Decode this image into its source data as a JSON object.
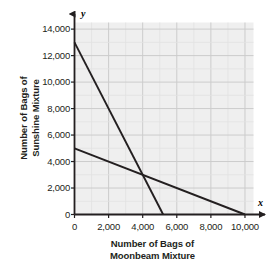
{
  "chart_data": {
    "type": "line",
    "title": "",
    "xlabel": "Number of Bags of Moonbeam Mixture",
    "ylabel": "Number of Bags of Sunshine Mixture",
    "xlabel_line1": "Number of Bags of",
    "xlabel_line2": "Moonbeam Mixture",
    "ylabel_line1": "Number of Bags of",
    "ylabel_line2": "Sunshine Mixture",
    "x_axis_letter": "x",
    "y_axis_letter": "y",
    "xlim": [
      0,
      10500
    ],
    "ylim": [
      0,
      14500
    ],
    "xticks": [
      0,
      2000,
      4000,
      6000,
      8000,
      10000
    ],
    "xtick_labels": [
      "0",
      "2,000",
      "4,000",
      "6,000",
      "8,000",
      "10,000"
    ],
    "yticks": [
      0,
      2000,
      4000,
      6000,
      8000,
      10000,
      12000,
      14000
    ],
    "ytick_labels": [
      "0",
      "2,000",
      "4,000",
      "6,000",
      "8,000",
      "10,000",
      "12,000",
      "14,000"
    ],
    "grid": true,
    "grid_minor_step_x": 1000,
    "grid_minor_step_y": 1000,
    "grid_color": "#d9d9d9",
    "plot_background": "#efefef",
    "line_color": "#231f20",
    "legend": "none",
    "series": [
      {
        "name": "steep-line",
        "points": [
          [
            0,
            13000
          ],
          [
            5200,
            0
          ]
        ],
        "x_intercept": 5200,
        "y_intercept": 13000
      },
      {
        "name": "shallow-line",
        "points": [
          [
            0,
            5000
          ],
          [
            10000,
            0
          ]
        ],
        "x_intercept": 10000,
        "y_intercept": 5000
      }
    ],
    "annotations": [
      {
        "label": "intersection",
        "x": 4000,
        "y": 3000
      }
    ]
  }
}
